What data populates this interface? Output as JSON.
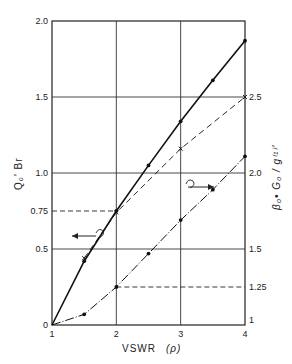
{
  "chart_data": {
    "type": "line",
    "title": "",
    "xlabel": "VSWR (ρ)",
    "ylabel_left": "Q0' Br",
    "ylabel_right": "β0• G0 / g(1)'",
    "xlim": [
      1,
      4
    ],
    "ylim_left": [
      0,
      2.0
    ],
    "ylim_right": [
      1,
      3.0
    ],
    "x_ticks": [
      "1",
      "2",
      "3",
      "4"
    ],
    "y_ticks_left": [
      "0",
      "0.5",
      "0.75",
      "1.0",
      "1.5",
      "2.0"
    ],
    "y_ticks_right": [
      "1",
      "1.25",
      "1.5",
      "2.0",
      "2.5"
    ],
    "grid": true,
    "series": [
      {
        "name": "Q0' Br (left axis)",
        "style": "solid",
        "marker": "dot",
        "axis": "left",
        "x": [
          1,
          1.5,
          2,
          2.5,
          3,
          3.5,
          4
        ],
        "y": [
          0,
          0.42,
          0.75,
          1.05,
          1.34,
          1.61,
          1.87
        ]
      },
      {
        "name": "β0 G0 / g(1)' (right axis, dashed)",
        "style": "dashed",
        "marker": "x",
        "axis": "right",
        "x": [
          1.5,
          2,
          3,
          4
        ],
        "y": [
          1.44,
          1.74,
          2.16,
          2.5
        ]
      },
      {
        "name": "β0 G0 / g(1)' (right axis, dash-dot)",
        "style": "dashdot",
        "marker": "dot",
        "axis": "right",
        "x": [
          1,
          1.5,
          2,
          2.5,
          3,
          3.5,
          4
        ],
        "y": [
          1.0,
          1.07,
          1.25,
          1.47,
          1.69,
          1.89,
          2.11
        ]
      }
    ],
    "annotations": [
      {
        "text": "reference 0.75 at VSWR 2 (dashed)",
        "axis": "left"
      },
      {
        "text": "reference 1.25 at VSWR 2 (dashed)",
        "axis": "right"
      },
      {
        "text": "arrow left indicating left axis for upper curve"
      },
      {
        "text": "arrow right indicating right axis for lower curve"
      }
    ]
  },
  "labels": {
    "xlabel": "VSWR",
    "xlabel_sym": "(ρ)",
    "ylabel_left": "Q₀' Br",
    "ylabel_right": "β₀• G₀ / g⁽¹⁾'"
  }
}
